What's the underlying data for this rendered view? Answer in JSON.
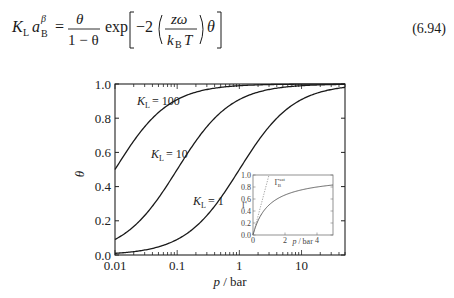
{
  "equation": {
    "lhs_K": "K",
    "lhs_K_sub": "L",
    "lhs_a": "a",
    "lhs_a_sub": "B",
    "lhs_a_sup": "β",
    "frac1_num": "θ",
    "frac1_den": "1 − θ",
    "exp": "exp",
    "minus_two": "−2",
    "frac2_num": "zω",
    "frac2_den_k": "k",
    "frac2_den_sub": "B",
    "frac2_den_T": "T",
    "theta": "θ",
    "number": "(6.94)"
  },
  "chart_data": {
    "type": "line",
    "title": "",
    "xlabel": "p / bar",
    "ylabel": "θ",
    "xscale": "log",
    "xlim": [
      0.01,
      50
    ],
    "ylim": [
      0.0,
      1.0
    ],
    "grid": false,
    "x_ticks": [
      "0.01",
      "0.1",
      "1",
      "10"
    ],
    "y_ticks": [
      "0.0",
      "0.2",
      "0.4",
      "0.6",
      "0.8",
      "1.0"
    ],
    "series": [
      {
        "name": "K_L = 100",
        "label": "K",
        "sub": "L",
        "value": "= 100",
        "K": 100,
        "x": [
          0.01,
          0.02,
          0.05,
          0.1,
          0.2,
          0.5,
          1,
          2,
          5,
          10,
          50
        ],
        "y": [
          0.5,
          0.67,
          0.83,
          0.91,
          0.95,
          0.98,
          0.99,
          0.995,
          0.998,
          0.999,
          1.0
        ]
      },
      {
        "name": "K_L = 10",
        "label": "K",
        "sub": "L",
        "value": "= 10",
        "K": 10,
        "x": [
          0.01,
          0.02,
          0.05,
          0.1,
          0.2,
          0.5,
          1,
          2,
          5,
          10,
          50
        ],
        "y": [
          0.09,
          0.17,
          0.33,
          0.5,
          0.67,
          0.83,
          0.91,
          0.95,
          0.98,
          0.99,
          0.998
        ]
      },
      {
        "name": "K_L = 1",
        "label": "K",
        "sub": "L",
        "value": "= 1",
        "K": 1,
        "x": [
          0.01,
          0.02,
          0.05,
          0.1,
          0.2,
          0.5,
          1,
          2,
          5,
          10,
          50
        ],
        "y": [
          0.01,
          0.02,
          0.05,
          0.09,
          0.17,
          0.33,
          0.5,
          0.67,
          0.83,
          0.91,
          0.98
        ]
      }
    ],
    "inset": {
      "type": "line",
      "xlabel": "p / bar",
      "ylabel": "Γ",
      "xlim": [
        0,
        5
      ],
      "ylim": [
        0.0,
        1.0
      ],
      "x_ticks": [
        "0",
        "2",
        "4"
      ],
      "y_ticks": [
        "0.0",
        "0.2",
        "0.4",
        "0.6",
        "0.8",
        "1.0"
      ],
      "annotation": "Γ_B^sat",
      "annotation_main": "Γ",
      "annotation_sub": "B",
      "annotation_sup": "sat",
      "series": [
        {
          "name": "Langmuir isotherm K=1",
          "style": "solid",
          "x": [
            0,
            0.5,
            1,
            2,
            3,
            4,
            5
          ],
          "y": [
            0,
            0.33,
            0.5,
            0.67,
            0.75,
            0.8,
            0.83
          ]
        },
        {
          "name": "initial slope",
          "style": "dotted",
          "x": [
            0,
            1
          ],
          "y": [
            0,
            1.0
          ]
        }
      ]
    }
  }
}
